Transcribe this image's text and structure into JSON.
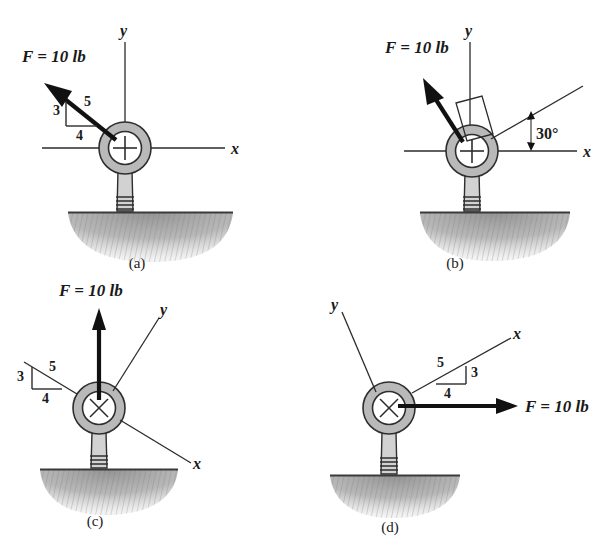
{
  "figure": {
    "title_partial": "",
    "background_color": "#ffffff",
    "ink_color": "#1a1a1a",
    "ring_fill_color": "#b9b9b9",
    "ground_fill_color": "#9a9a9a"
  },
  "panels": [
    {
      "id": "a",
      "caption": "(a)",
      "force_label": "F = 10 lb",
      "force_magnitude": "10",
      "force_unit": "lb",
      "force_direction": "up-left",
      "axes": {
        "x_label": "x",
        "y_label": "y",
        "orientation": "standard",
        "x_axis_angle_deg": "0",
        "y_axis_angle_deg": "90"
      },
      "slope_triangle": {
        "vertical_label": "3",
        "horizontal_label": "4",
        "hypotenuse_label": "5",
        "position": "on-force-line"
      },
      "angle_label": null,
      "anchor": "eyebolt-in-ground"
    },
    {
      "id": "b",
      "caption": "(b)",
      "force_label": "F = 10 lb",
      "force_magnitude": "10",
      "force_unit": "lb",
      "force_direction": "up-left",
      "axes": {
        "x_label": "x",
        "y_label": "y",
        "orientation": "standard",
        "x_axis_angle_deg": "0",
        "y_axis_angle_deg": "90"
      },
      "slope_triangle": null,
      "angle_label": "30°",
      "inclined_line_angle_deg": "30",
      "right_angle_mark": "true",
      "anchor": "eyebolt-in-ground"
    },
    {
      "id": "c",
      "caption": "(c)",
      "force_label": "F = 10 lb",
      "force_magnitude": "10",
      "force_unit": "lb",
      "force_direction": "up-vertical",
      "axes": {
        "x_label": "x",
        "y_label": "y",
        "orientation": "rotated",
        "x_axis_angle_deg": "-37",
        "y_axis_angle_deg": "53"
      },
      "slope_triangle": {
        "vertical_label": "3",
        "horizontal_label": "4",
        "hypotenuse_label": "5",
        "position": "on-x-axis"
      },
      "angle_label": null,
      "anchor": "eyebolt-in-ground"
    },
    {
      "id": "d",
      "caption": "(d)",
      "force_label": "F = 10 lb",
      "force_magnitude": "10",
      "force_unit": "lb",
      "force_direction": "right-horizontal",
      "axes": {
        "x_label": "x",
        "y_label": "y",
        "orientation": "rotated",
        "x_axis_angle_deg": "37",
        "y_axis_angle_deg": "127"
      },
      "slope_triangle": {
        "vertical_label": "3",
        "horizontal_label": "4",
        "hypotenuse_label": "5",
        "position": "on-x-axis"
      },
      "angle_label": null,
      "anchor": "eyebolt-in-ground"
    }
  ]
}
